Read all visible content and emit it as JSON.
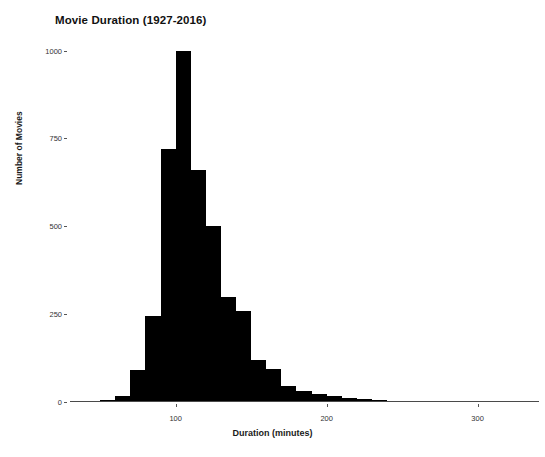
{
  "chart_data": {
    "type": "bar",
    "title": "Movie Duration (1927-2016)",
    "xlabel": "Duration (minutes)",
    "ylabel": "Number of Movies",
    "xlim": [
      30,
      340
    ],
    "ylim": [
      0,
      1030
    ],
    "grid": false,
    "legend": "none",
    "bin_width": 10,
    "bar_color": "#000000",
    "xticks": [
      100,
      200,
      300
    ],
    "xtick_labels": [
      "100",
      "200",
      "300"
    ],
    "yticks": [
      0,
      250,
      500,
      750,
      1000
    ],
    "ytick_labels": [
      "0",
      "250",
      "500",
      "750",
      "1000"
    ],
    "bins": [
      {
        "x": 35,
        "value": 1
      },
      {
        "x": 45,
        "value": 2
      },
      {
        "x": 55,
        "value": 6
      },
      {
        "x": 65,
        "value": 18
      },
      {
        "x": 75,
        "value": 90
      },
      {
        "x": 85,
        "value": 245
      },
      {
        "x": 95,
        "value": 720
      },
      {
        "x": 105,
        "value": 1000
      },
      {
        "x": 115,
        "value": 660
      },
      {
        "x": 125,
        "value": 500
      },
      {
        "x": 135,
        "value": 300
      },
      {
        "x": 145,
        "value": 260
      },
      {
        "x": 155,
        "value": 120
      },
      {
        "x": 165,
        "value": 95
      },
      {
        "x": 175,
        "value": 45
      },
      {
        "x": 185,
        "value": 30
      },
      {
        "x": 195,
        "value": 22
      },
      {
        "x": 205,
        "value": 16
      },
      {
        "x": 215,
        "value": 12
      },
      {
        "x": 225,
        "value": 10
      },
      {
        "x": 235,
        "value": 6
      },
      {
        "x": 245,
        "value": 4
      },
      {
        "x": 255,
        "value": 3
      },
      {
        "x": 265,
        "value": 2
      },
      {
        "x": 285,
        "value": 2
      },
      {
        "x": 295,
        "value": 2
      },
      {
        "x": 315,
        "value": 2
      },
      {
        "x": 330,
        "value": 2
      }
    ]
  }
}
